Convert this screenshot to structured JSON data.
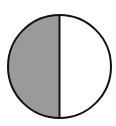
{
  "diagram": {
    "type": "fraction-circle",
    "parts_total": 2,
    "parts_shaded": 1,
    "fraction": "1/2",
    "shaded_side": "left",
    "colors": {
      "shaded_fill": "#9a9a9a",
      "unshaded_fill": "#ffffff",
      "stroke": "#111111",
      "background": "#ffffff"
    },
    "geometry": {
      "cx": 59.5,
      "cy": 66.5,
      "r": 51.5
    }
  }
}
